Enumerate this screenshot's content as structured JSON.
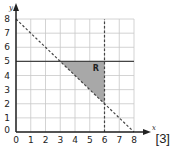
{
  "diagram": {
    "type": "coordinate-grid-region",
    "axes": {
      "x_label": "x",
      "y_label": "y",
      "x_ticks": [
        "0",
        "1",
        "2",
        "3",
        "4",
        "5",
        "6",
        "7",
        "8"
      ],
      "y_ticks": [
        "0",
        "1",
        "2",
        "3",
        "4",
        "5",
        "6",
        "7",
        "8"
      ],
      "x_range": [
        0,
        8
      ],
      "y_range": [
        0,
        8
      ]
    },
    "lines": [
      {
        "name": "y = 5",
        "style": "solid",
        "from": [
          0,
          5
        ],
        "to": [
          8,
          5
        ]
      },
      {
        "name": "x = 6",
        "style": "dashed",
        "from": [
          6,
          0
        ],
        "to": [
          6,
          8
        ]
      },
      {
        "name": "x + y = 8",
        "style": "dashed",
        "from": [
          0,
          8
        ],
        "to": [
          8,
          0
        ]
      }
    ],
    "region": {
      "label": "R",
      "vertices": [
        [
          3,
          5
        ],
        [
          6,
          5
        ],
        [
          6,
          2
        ]
      ],
      "fill": "#a8a8a8"
    },
    "colors": {
      "grid": "#c8c8c8",
      "axis": "#222222",
      "line": "#444444"
    }
  },
  "marks": "[3]"
}
